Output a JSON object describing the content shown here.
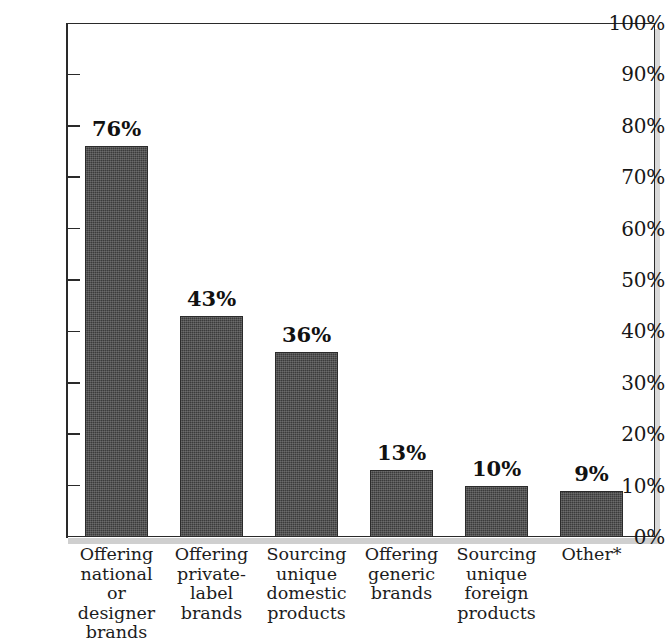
{
  "chart_data": {
    "type": "bar",
    "title": "",
    "subtitle": "",
    "xlabel": "",
    "ylabel": "",
    "ylim": [
      0,
      100
    ],
    "grid": false,
    "legend": "none",
    "value_label_suffix": "%",
    "categories": [
      "Offering national or designer brands",
      "Offering private-label brands",
      "Sourcing unique domestic products",
      "Offering generic brands",
      "Sourcing unique foreign products",
      "Other*"
    ],
    "category_lines": [
      [
        "Offering",
        "national or",
        "designer",
        "brands"
      ],
      [
        "Offering",
        "private-label",
        "brands"
      ],
      [
        "Sourcing",
        "unique",
        "domestic",
        "products"
      ],
      [
        "Offering",
        "generic",
        "brands"
      ],
      [
        "Sourcing",
        "unique",
        "foreign",
        "products"
      ],
      [
        "Other*"
      ]
    ],
    "values": [
      76,
      43,
      36,
      13,
      10,
      9
    ],
    "value_labels": [
      "76%",
      "43%",
      "36%",
      "13%",
      "10%",
      "9%"
    ],
    "ytick_labels": [
      "100%",
      "90%",
      "80%",
      "70%",
      "60%",
      "50%",
      "40%",
      "30%",
      "20%",
      "10%",
      "0%"
    ],
    "ytick_values": [
      100,
      90,
      80,
      70,
      60,
      50,
      40,
      30,
      20,
      10,
      0
    ],
    "colors": {
      "bar_fill": "#3b3b3b",
      "bar_border": "#2b2b2b",
      "axis": "#2a2a2a",
      "text": "#171717",
      "plot_background": "#ffffff"
    }
  }
}
